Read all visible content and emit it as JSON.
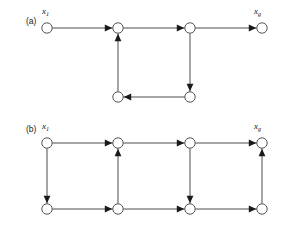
{
  "figure": {
    "background_color": "#ffffff",
    "stroke_color": "#4d4d4d",
    "node_fill": "#ffffff",
    "node_stroke": "#555555",
    "arrow_color": "#1a1a1a",
    "width": 283,
    "height": 229
  },
  "panels": [
    {
      "id": "a",
      "label": "(a)",
      "start_label_text": "x",
      "start_label_sub": "1",
      "goal_label_text": "x",
      "goal_label_sub": "g",
      "nodes": [
        {
          "id": "a-n1",
          "name": "start-node",
          "cx": 47,
          "cy": 28,
          "r": 5.2
        },
        {
          "id": "a-n2",
          "name": "node",
          "cx": 118,
          "cy": 28,
          "r": 5.2
        },
        {
          "id": "a-n3",
          "name": "node",
          "cx": 190,
          "cy": 28,
          "r": 5.2
        },
        {
          "id": "a-n4",
          "name": "goal-node",
          "cx": 262,
          "cy": 28,
          "r": 5.2
        },
        {
          "id": "a-n5",
          "name": "node",
          "cx": 118,
          "cy": 97,
          "r": 5.2
        },
        {
          "id": "a-n6",
          "name": "node",
          "cx": 190,
          "cy": 97,
          "r": 5.2
        }
      ],
      "edges": [
        {
          "from": "a-n1",
          "to": "a-n2",
          "dir": "right"
        },
        {
          "from": "a-n2",
          "to": "a-n3",
          "dir": "right"
        },
        {
          "from": "a-n3",
          "to": "a-n4",
          "dir": "right"
        },
        {
          "from": "a-n3",
          "to": "a-n6",
          "dir": "down"
        },
        {
          "from": "a-n6",
          "to": "a-n5",
          "dir": "left"
        },
        {
          "from": "a-n5",
          "to": "a-n2",
          "dir": "up"
        }
      ]
    },
    {
      "id": "b",
      "label": "(b)",
      "start_label_text": "x",
      "start_label_sub": "1",
      "goal_label_text": "x",
      "goal_label_sub": "g",
      "nodes": [
        {
          "id": "b-t1",
          "name": "start-node",
          "cx": 47,
          "cy": 143,
          "r": 5.2
        },
        {
          "id": "b-t2",
          "name": "node",
          "cx": 118,
          "cy": 143,
          "r": 5.2
        },
        {
          "id": "b-t3",
          "name": "node",
          "cx": 190,
          "cy": 143,
          "r": 5.2
        },
        {
          "id": "b-t4",
          "name": "goal-node",
          "cx": 262,
          "cy": 143,
          "r": 5.2
        },
        {
          "id": "b-b1",
          "name": "node",
          "cx": 47,
          "cy": 209,
          "r": 5.2
        },
        {
          "id": "b-b2",
          "name": "node",
          "cx": 118,
          "cy": 209,
          "r": 5.2
        },
        {
          "id": "b-b3",
          "name": "node",
          "cx": 190,
          "cy": 209,
          "r": 5.2
        },
        {
          "id": "b-b4",
          "name": "node",
          "cx": 262,
          "cy": 209,
          "r": 5.2
        }
      ],
      "edges": [
        {
          "from": "b-t1",
          "to": "b-t2",
          "dir": "right"
        },
        {
          "from": "b-t2",
          "to": "b-t3",
          "dir": "right"
        },
        {
          "from": "b-t3",
          "to": "b-t4",
          "dir": "right"
        },
        {
          "from": "b-b1",
          "to": "b-b2",
          "dir": "right"
        },
        {
          "from": "b-b2",
          "to": "b-b3",
          "dir": "right"
        },
        {
          "from": "b-b3",
          "to": "b-b4",
          "dir": "right"
        },
        {
          "from": "b-t1",
          "to": "b-b1",
          "dir": "down"
        },
        {
          "from": "b-b2",
          "to": "b-t2",
          "dir": "up"
        },
        {
          "from": "b-t3",
          "to": "b-b3",
          "dir": "down"
        },
        {
          "from": "b-b4",
          "to": "b-t4",
          "dir": "up"
        }
      ]
    }
  ]
}
